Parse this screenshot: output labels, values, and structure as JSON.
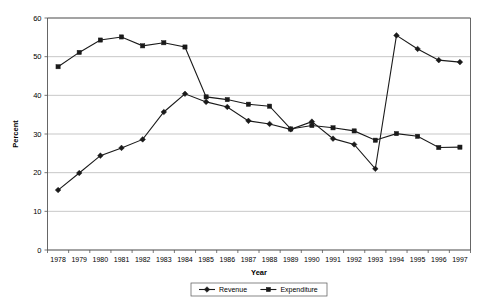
{
  "chart_data": {
    "type": "line",
    "title": "",
    "xlabel": "Year",
    "ylabel": "Percent",
    "ylim": [
      0,
      60
    ],
    "ytick_step": 10,
    "yticks": [
      0,
      10,
      20,
      30,
      40,
      50,
      60
    ],
    "grid": true,
    "legend_position": "bottom",
    "categories": [
      "1978",
      "1979",
      "1980",
      "1981",
      "1982",
      "1983",
      "1984",
      "1985",
      "1986",
      "1987",
      "1988",
      "1989",
      "1990",
      "1991",
      "1992",
      "1993",
      "1994",
      "1995",
      "1996",
      "1997"
    ],
    "series": [
      {
        "name": "Revenue",
        "marker": "diamond",
        "color": "#1a1a1a",
        "values": [
          15.5,
          19.9,
          24.4,
          26.4,
          28.6,
          35.7,
          40.4,
          38.3,
          37.0,
          33.4,
          32.6,
          31.2,
          33.2,
          28.8,
          27.3,
          21.0,
          55.5,
          52.0,
          49.1,
          48.6
        ]
      },
      {
        "name": "Expenditure",
        "marker": "square",
        "color": "#1a1a1a",
        "values": [
          47.4,
          51.1,
          54.3,
          55.1,
          52.8,
          53.6,
          52.5,
          39.6,
          38.9,
          37.7,
          37.2,
          31.3,
          32.2,
          31.6,
          30.8,
          28.4,
          30.1,
          29.4,
          26.5,
          26.6
        ]
      }
    ]
  },
  "legend": {
    "entries": [
      {
        "label": "Revenue",
        "marker": "diamond"
      },
      {
        "label": "Expenditure",
        "marker": "square"
      }
    ]
  },
  "axes": {
    "y_title": "Percent",
    "x_title": "Year"
  }
}
